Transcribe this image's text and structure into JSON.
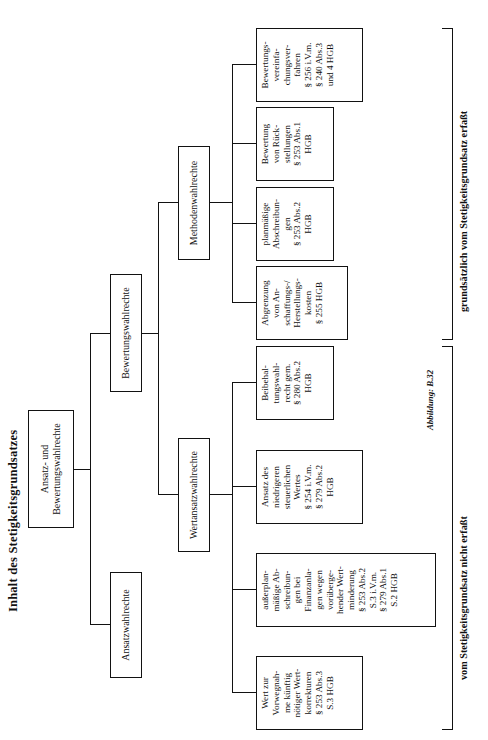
{
  "figure": {
    "title": "Inhalt des Stetigkeitsgrundsatzes",
    "source_caption": "Abbildung: B.32"
  },
  "tree": {
    "root": {
      "label": "Ansatz- und\nBewertungswahlrechte"
    },
    "level1": [
      {
        "label": "Ansatzwahlrechte"
      },
      {
        "label": "Bewertungswahlrechte"
      }
    ],
    "level2": [
      {
        "label": "Wertansatzwahlrechte"
      },
      {
        "label": "Methodenwahlrechte"
      }
    ],
    "leaves": [
      {
        "id": "leaf-wert-vorwegnahme",
        "label": "Wert zur\nVorwegnah-\nme künftig\nnötiger Wert-\nkorrekturen\n§ 253 Abs.3\nS.3 HGB"
      },
      {
        "id": "leaf-ausserplanmaessige-abschreibungen",
        "label": "außerplan-\nmäßige Ab-\nschreibun-\ngen bei\nFinanzanla-\ngen wegen\nvorüberge-\nhender Wert-\nminderung\n§ 253 Abs.2\nS.3 i.V.m.\n§ 279 Abs.1\nS.2 HGB"
      },
      {
        "id": "leaf-niedrigerer-steuerlicher-wert",
        "label": "Ansatz des\nniedrigeren\nsteuerlichen\nWertes\n§ 254 i.V.m.\n§ 279 Abs.2\nHGB"
      },
      {
        "id": "leaf-beibehaltungswahlrecht",
        "label": "Beibehal-\ntungswahl-\nrecht gem.\n§ 280 Abs.2\nHGB"
      },
      {
        "id": "leaf-abgrenzung-ahk",
        "label": "Abgrenzung\nvon An-\nschaffungs-/\nHerstellungs-\nkosten\n§ 255 HGB"
      },
      {
        "id": "leaf-planmaessige-abschreibungen",
        "label": "planmäßige\nAbschreibun-\ngen\n§ 253 Abs.2\nHGB"
      },
      {
        "id": "leaf-bewertung-rueckstellungen",
        "label": "Bewertung\nvon Rück-\nstellungen\n§ 253 Abs.1\nHGB"
      },
      {
        "id": "leaf-bewertungsvereinfachung",
        "label": "Bewertungs-\nvereinfa-\nchungsver-\nfahren\n§ 256 i.V.m.\n§ 240 Abs.3\nund 4 HGB"
      }
    ]
  },
  "braces": [
    {
      "id": "brace-nicht-erfasst",
      "label": "vom Stetigkeitsgrundsatz nicht erfaßt"
    },
    {
      "id": "brace-erfasst",
      "label": "grundsätzlich vom Stetigkeitsgrundsatz erfaßt"
    }
  ],
  "colors": {
    "ink": "#121212",
    "page": "#ffffff"
  }
}
